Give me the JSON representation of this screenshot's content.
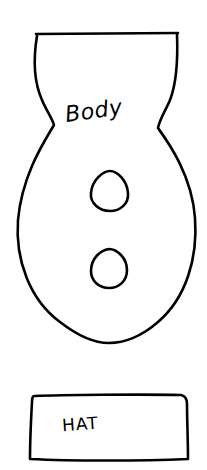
{
  "diagram": {
    "type": "craft-template",
    "background": "#ffffff",
    "stroke_color": "#000000",
    "pieces": [
      {
        "name": "body",
        "label": "Body",
        "holes": 2
      },
      {
        "name": "hat",
        "label": "HAT"
      }
    ]
  }
}
